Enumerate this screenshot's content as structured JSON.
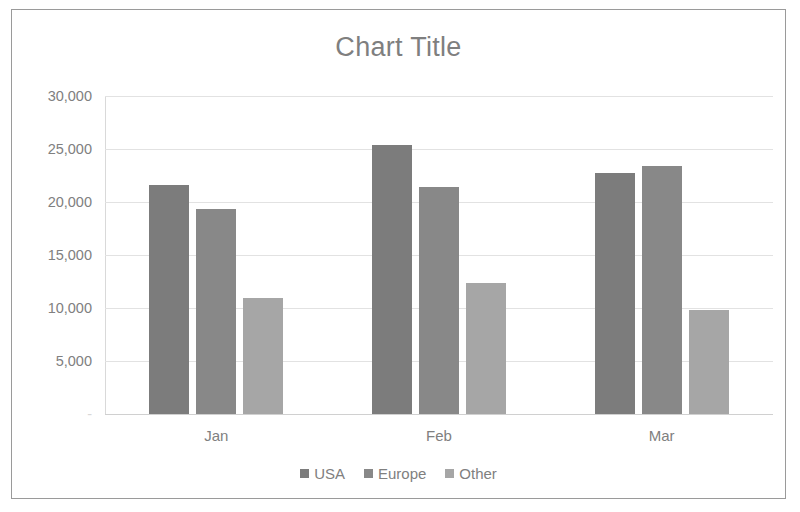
{
  "chart_data": {
    "type": "bar",
    "title": "Chart Title",
    "xlabel": "",
    "ylabel": "",
    "categories": [
      "Jan",
      "Feb",
      "Mar"
    ],
    "series": [
      {
        "name": "USA",
        "color": "#7c7c7c",
        "values": [
          21650,
          25350,
          22700
        ]
      },
      {
        "name": "Europe",
        "color": "#888888",
        "values": [
          19300,
          21450,
          23400
        ]
      },
      {
        "name": "Other",
        "color": "#a6a6a6",
        "values": [
          10900,
          12350,
          9800
        ]
      }
    ],
    "ylim": [
      0,
      30000
    ],
    "yticks": [
      0,
      5000,
      10000,
      15000,
      20000,
      25000,
      30000
    ],
    "ytick_labels": [
      "-",
      "5,000",
      "10,000",
      "15,000",
      "20,000",
      "25,000",
      "30,000"
    ],
    "grid": true,
    "legend_position": "bottom"
  }
}
